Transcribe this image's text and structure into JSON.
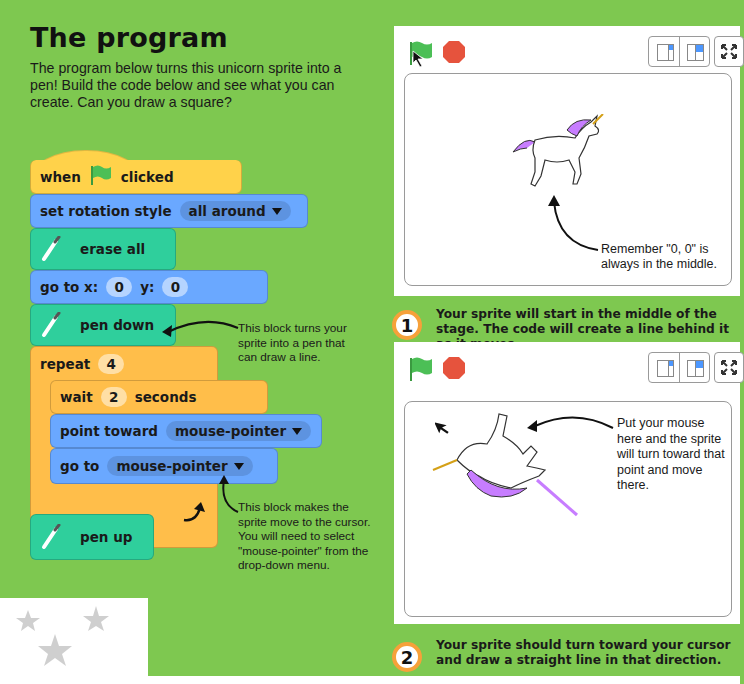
{
  "heading": "The program",
  "intro": "The program below turns this unicorn sprite into a pen! Build the code below and see what you can create. Can you draw a square?",
  "blocks": {
    "when_clicked": {
      "before": "when",
      "after": "clicked",
      "icon": "green-flag-icon"
    },
    "rotation": {
      "label": "set rotation style",
      "value": "all around"
    },
    "erase": {
      "label": "erase all",
      "icon": "pen-icon"
    },
    "goto_xy": {
      "label": "go to x:",
      "x": "0",
      "y_label": "y:",
      "y": "0"
    },
    "pen_down": {
      "label": "pen down",
      "icon": "pen-icon"
    },
    "repeat": {
      "label": "repeat",
      "value": "4"
    },
    "wait": {
      "label": "wait",
      "value": "2",
      "unit": "seconds"
    },
    "point_toward": {
      "label": "point toward",
      "value": "mouse-pointer"
    },
    "go_to": {
      "label": "go to",
      "value": "mouse-pointer"
    },
    "pen_up": {
      "label": "pen up",
      "icon": "pen-icon"
    }
  },
  "notes": {
    "pen_down": "This block turns your sprite into a pen that can draw a line.",
    "go_to": "This block makes the sprite move to the cursor. You will need to select \"mouse-pointer\" from the drop-down menu."
  },
  "stage1": {
    "annotation": "Remember \"0, 0\" is always in the middle.",
    "step": "1",
    "caption": "Your sprite will start in the middle of the stage. The code will create a line behind it as it moves."
  },
  "stage2": {
    "annotation": "Put your mouse here and the sprite will turn toward that point and move there.",
    "step": "2",
    "caption": "Your sprite should turn toward your cursor and draw a straight line in that direction."
  },
  "colors": {
    "background": "#7ec850",
    "event": "#ffd24a",
    "motion": "#6aa8ff",
    "pen": "#2fcf9c",
    "control": "#ffbe4a",
    "flag": "#4cbf56",
    "stop": "#e6533d",
    "step_ring": "#f6a13a"
  }
}
